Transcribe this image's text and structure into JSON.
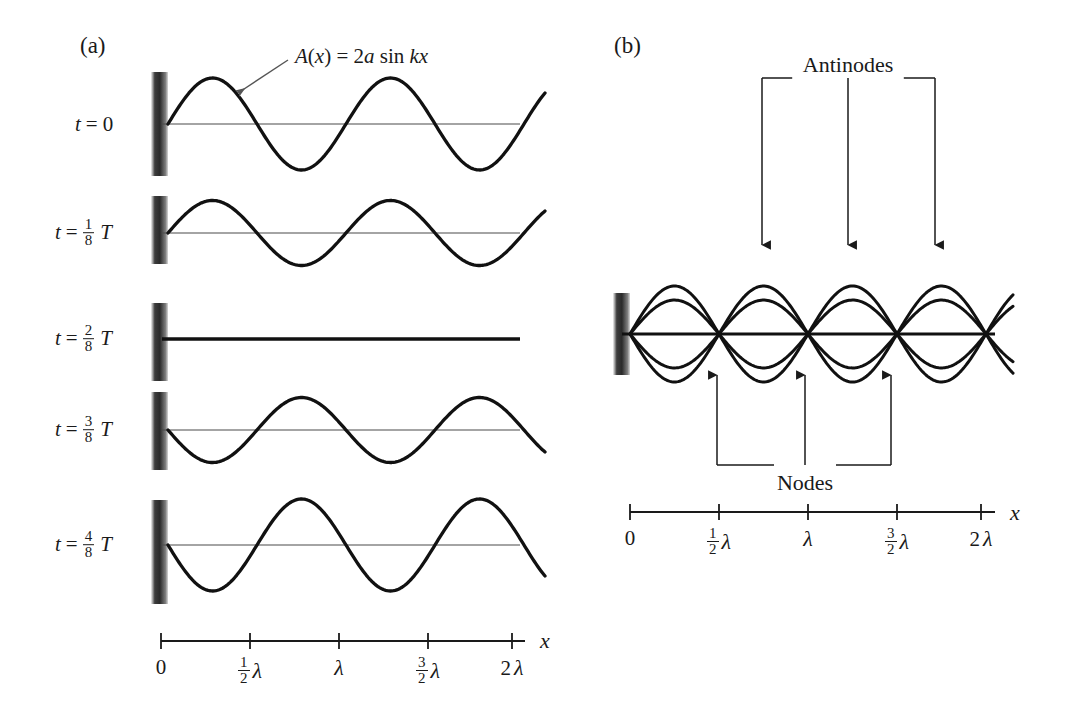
{
  "figure": {
    "background": "#ffffff",
    "ink": "#1a1a1a",
    "axis_color": "#4a4a4a"
  },
  "panel_a": {
    "label": "(a)",
    "callout": {
      "text_parts": {
        "fn": "A(x)",
        "eq": "=",
        "amp": "2a",
        "sin": "sin",
        "arg": "kx"
      },
      "full_text": "A(x) = 2a sin kx"
    },
    "rows": [
      {
        "id": "t0",
        "t_prefix": "t",
        "eq": "=",
        "value": "0",
        "has_fraction": false,
        "num": "",
        "den": "",
        "T": "",
        "amplitude_factor": 1.0,
        "flat": false,
        "baseline_y": 124,
        "label_x": 75
      },
      {
        "id": "t1_8",
        "t_prefix": "t",
        "eq": "=",
        "value": "",
        "has_fraction": true,
        "num": "1",
        "den": "8",
        "T": "T",
        "amplitude_factor": 0.707,
        "flat": false,
        "baseline_y": 233,
        "label_x": 55
      },
      {
        "id": "t2_8",
        "t_prefix": "t",
        "eq": "=",
        "value": "",
        "has_fraction": true,
        "num": "2",
        "den": "8",
        "T": "T",
        "amplitude_factor": 0.0,
        "flat": true,
        "baseline_y": 339,
        "label_x": 55
      },
      {
        "id": "t3_8",
        "t_prefix": "t",
        "eq": "=",
        "value": "",
        "has_fraction": true,
        "num": "3",
        "den": "8",
        "T": "T",
        "amplitude_factor": -0.707,
        "flat": false,
        "baseline_y": 430,
        "label_x": 55
      },
      {
        "id": "t4_8",
        "t_prefix": "t",
        "eq": "=",
        "value": "",
        "has_fraction": true,
        "num": "4",
        "den": "8",
        "T": "T",
        "amplitude_factor": -1.0,
        "flat": false,
        "baseline_y": 545,
        "label_x": 55
      }
    ],
    "wall": {
      "x": 151,
      "width": 17,
      "rows_y": [
        72,
        196,
        303,
        392,
        500
      ],
      "heights": [
        104,
        68,
        78,
        78,
        104
      ]
    },
    "axis": {
      "x_start": 161,
      "x_end": 525,
      "y": 641,
      "var_label": "x",
      "var_x": 540,
      "var_y": 628,
      "ticks": [
        {
          "x": 161,
          "label": "0",
          "frac": false,
          "num": "",
          "den": "",
          "lam": ""
        },
        {
          "x": 250,
          "label": "",
          "frac": true,
          "num": "1",
          "den": "2",
          "lam": "λ"
        },
        {
          "x": 339,
          "label": "",
          "frac": false,
          "num": "",
          "den": "",
          "lam": "λ"
        },
        {
          "x": 428,
          "label": "",
          "frac": true,
          "num": "3",
          "den": "2",
          "lam": "λ"
        },
        {
          "x": 512,
          "label": "2",
          "frac": false,
          "num": "",
          "den": "",
          "lam": "λ"
        }
      ],
      "label_y": 655
    },
    "wave_geometry": {
      "x_start": 168,
      "x_end": 545,
      "wavelength_px": 178,
      "amplitude_px": 46
    }
  },
  "panel_b": {
    "label": "(b)",
    "annotations": [
      {
        "name": "antinodes",
        "text": "Antinodes",
        "x": 848,
        "y": 52,
        "direction": "down",
        "arrow_x": [
          762,
          848,
          935
        ],
        "arrow_tip_y": 245,
        "bracket_y": 78
      },
      {
        "name": "nodes",
        "text": "Nodes",
        "x": 805,
        "y": 470,
        "direction": "up",
        "arrow_x": [
          717,
          805,
          891
        ],
        "arrow_tip_y": 375,
        "bracket_y": 465
      }
    ],
    "wall": {
      "x": 613,
      "y": 293,
      "width": 17,
      "height": 82
    },
    "baseline_y": 334,
    "snapshots": [
      {
        "id": "env_pos",
        "amplitude_factor": 1.0
      },
      {
        "id": "env_neg",
        "amplitude_factor": -1.0
      },
      {
        "id": "mid_pos",
        "amplitude_factor": 0.707
      },
      {
        "id": "mid_neg",
        "amplitude_factor": -0.707
      }
    ],
    "axis": {
      "x_start": 630,
      "x_end": 995,
      "y": 512,
      "var_label": "x",
      "var_x": 1010,
      "var_y": 500,
      "ticks": [
        {
          "x": 630,
          "label": "0",
          "frac": false,
          "num": "",
          "den": "",
          "lam": ""
        },
        {
          "x": 719,
          "label": "",
          "frac": true,
          "num": "1",
          "den": "2",
          "lam": "λ"
        },
        {
          "x": 808,
          "label": "",
          "frac": false,
          "num": "",
          "den": "",
          "lam": "λ"
        },
        {
          "x": 897,
          "label": "",
          "frac": true,
          "num": "3",
          "den": "2",
          "lam": "λ"
        },
        {
          "x": 981,
          "label": "2",
          "frac": false,
          "num": "",
          "den": "",
          "lam": "λ"
        }
      ],
      "label_y": 526
    },
    "wave_geometry": {
      "x_start": 630,
      "x_end": 1013,
      "wavelength_px": 178,
      "amplitude_px": 48
    }
  },
  "chart_data": {
    "type": "line",
    "xlabel": "x",
    "ylabel": "",
    "x_tick_labels": [
      "0",
      "1/2 λ",
      "λ",
      "3/2 λ",
      "2λ"
    ],
    "x_tick_values": [
      0,
      0.5,
      1.0,
      1.5,
      2.0
    ],
    "equation": "A(x) = 2a sin kx",
    "panel_a_series": [
      {
        "name": "t = 0",
        "amplitude": 1.0,
        "phase_sign": 1
      },
      {
        "name": "t = 1/8 T",
        "amplitude": 0.707,
        "phase_sign": 1
      },
      {
        "name": "t = 2/8 T",
        "amplitude": 0.0,
        "phase_sign": 0
      },
      {
        "name": "t = 3/8 T",
        "amplitude": 0.707,
        "phase_sign": -1
      },
      {
        "name": "t = 4/8 T",
        "amplitude": 1.0,
        "phase_sign": -1
      }
    ],
    "panel_b_series": [
      {
        "name": "envelope +",
        "amplitude": 1.0
      },
      {
        "name": "envelope -",
        "amplitude": -1.0
      },
      {
        "name": "intermediate +",
        "amplitude": 0.707
      },
      {
        "name": "intermediate -",
        "amplitude": -0.707
      }
    ],
    "nodes_x": [
      0.5,
      1.0,
      1.5,
      2.0
    ],
    "antinodes_x": [
      0.25,
      0.75,
      1.25,
      1.75
    ],
    "legend": [
      "Antinodes",
      "Nodes"
    ],
    "grid": false
  }
}
